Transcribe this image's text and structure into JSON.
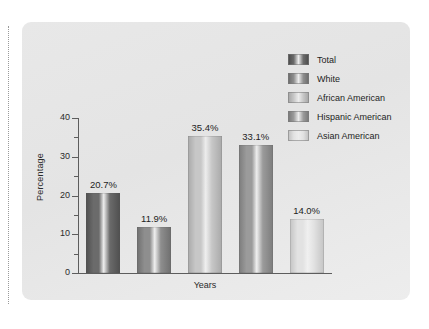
{
  "figure": {
    "background_color": "#e8e8e8",
    "page_background": "#ffffff",
    "margin_guide_color": "#9a9a9a"
  },
  "chart_data": {
    "type": "bar",
    "title": "",
    "xlabel": "Years",
    "ylabel": "Percentage",
    "ylim": [
      0,
      40
    ],
    "yticks": [
      0,
      10,
      20,
      30,
      40
    ],
    "yminorticks": [
      5,
      15,
      25,
      35
    ],
    "grid": false,
    "legend_position": "top-right",
    "categories": [
      "Total",
      "White",
      "African American",
      "Hispanic American",
      "Asian American"
    ],
    "values": [
      20.7,
      11.9,
      35.4,
      33.1,
      14.0
    ],
    "value_labels": [
      "20.7%",
      "11.9%",
      "35.4%",
      "33.1%",
      "14.0%"
    ],
    "colors": [
      "#6b6b6b",
      "#8e8e8e",
      "#c7c7c7",
      "#9b9b9b",
      "#e2e2e2"
    ],
    "bar_edge_colors": [
      "#4f4f4f",
      "#6f6f6f",
      "#a9a9a9",
      "#7c7c7c",
      "#c4c4c4"
    ]
  },
  "legend": {
    "items": [
      {
        "label": "Total",
        "color": "#6b6b6b"
      },
      {
        "label": "White",
        "color": "#8e8e8e"
      },
      {
        "label": "African American",
        "color": "#c7c7c7"
      },
      {
        "label": "Hispanic American",
        "color": "#9b9b9b"
      },
      {
        "label": "Asian American",
        "color": "#e2e2e2"
      }
    ]
  },
  "axis": {
    "y_labels": [
      "40",
      "30",
      "20",
      "10",
      "0"
    ],
    "y_title": "Percentage",
    "x_title": "Years"
  }
}
